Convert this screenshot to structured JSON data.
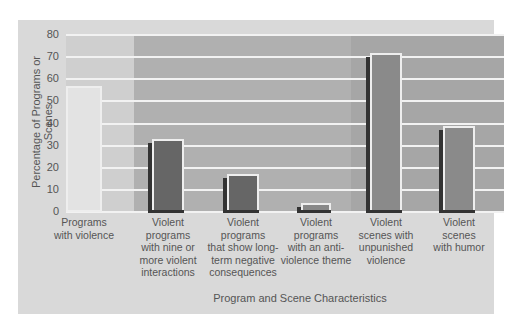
{
  "chart_data": {
    "type": "bar",
    "title": "",
    "xlabel": "Program and Scene Characteristics",
    "ylabel": "Percentage of Programs or Scenes",
    "ylim": [
      0,
      80
    ],
    "yticks": [
      0,
      10,
      20,
      30,
      40,
      50,
      60,
      70,
      80
    ],
    "grid": true,
    "categories": [
      "Programs with violence",
      "Violent programs with nine or more violent interactions",
      "Violent programs that show long-term negative consequences",
      "Violent programs with an anti-violence theme",
      "Violent scenes with unpunished violence",
      "Violent scenes with humor"
    ],
    "category_labels_wrapped": [
      "Programs\nwith violence",
      "Violent\nprograms\nwith nine or\nmore violent\ninteractions",
      "Violent\nprograms\nthat show long-\nterm negative\nconsequences",
      "Violent\nprograms\nwith an anti-\nviolence theme",
      "Violent\nscenes with\nunpunished\nviolence",
      "Violent\nscenes\nwith humor"
    ],
    "values": [
      57,
      33,
      17,
      4,
      72,
      39
    ],
    "bar_colors": [
      "#e3e3e3",
      "#666666",
      "#666666",
      "#888888",
      "#8a8a8a",
      "#8a8a8a"
    ],
    "band_colors": [
      "#cfcfcf",
      "#b0b0b0",
      "#a6a6a6"
    ]
  }
}
